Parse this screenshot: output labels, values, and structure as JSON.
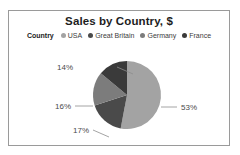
{
  "card": {
    "border_color": "#9a9a9a",
    "background": "#ffffff"
  },
  "chart_data": {
    "type": "pie",
    "title": "Sales by Country, $",
    "legend_title": "Country",
    "legend_position": "top",
    "categories": [
      "USA",
      "Great Britain",
      "Germany",
      "France"
    ],
    "values": [
      53,
      17,
      16,
      14
    ],
    "value_labels": [
      "53%",
      "17%",
      "16%",
      "14%"
    ],
    "colors": [
      "#a3a3a3",
      "#4a4a4a",
      "#7c7c7c",
      "#3a3a3a"
    ],
    "units": "percent",
    "xlabel": "",
    "ylabel": "",
    "grid": false
  },
  "legend": [
    {
      "label": "USA",
      "color": "#a3a3a3"
    },
    {
      "label": "Great Britain",
      "color": "#4a4a4a"
    },
    {
      "label": "Germany",
      "color": "#7c7c7c"
    },
    {
      "label": "France",
      "color": "#3a3a3a"
    }
  ],
  "labels": {
    "usa": "53%",
    "great_britain": "17%",
    "germany": "16%",
    "france": "14%"
  }
}
